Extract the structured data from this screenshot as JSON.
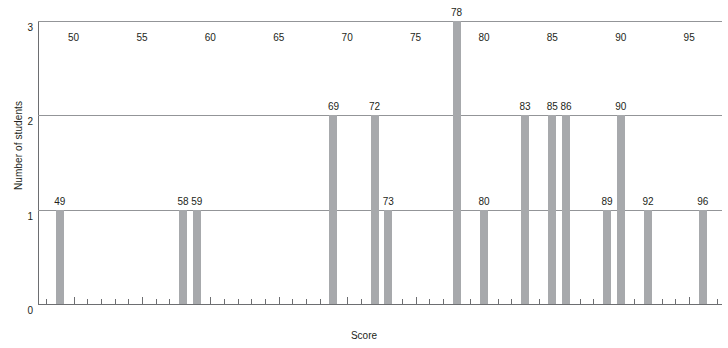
{
  "chart_data": {
    "type": "bar",
    "title": "",
    "xlabel": "Score",
    "ylabel": "Number of students",
    "xlim": [
      47.4,
      97.4
    ],
    "ylim": [
      0,
      3
    ],
    "grid": true,
    "legend": null,
    "x_tick_step": 1,
    "x_label_step": 5,
    "x_tick_labels": [
      "50",
      "55",
      "60",
      "65",
      "70",
      "75",
      "80",
      "85",
      "90",
      "95"
    ],
    "x_tick_label_values": [
      50,
      55,
      60,
      65,
      70,
      75,
      80,
      85,
      90,
      95
    ],
    "y_tick_labels": [
      "0",
      "1",
      "2",
      "3"
    ],
    "y_tick_values": [
      0,
      1,
      2,
      3
    ],
    "categories": [
      49,
      58,
      59,
      69,
      72,
      73,
      78,
      80,
      83,
      85,
      86,
      89,
      90,
      92,
      96
    ],
    "values": [
      1,
      1,
      1,
      2,
      2,
      1,
      3,
      1,
      2,
      2,
      2,
      1,
      2,
      1,
      1
    ],
    "bar_labels": [
      "49",
      "58",
      "59",
      "69",
      "72",
      "73",
      "78",
      "80",
      "83",
      "85",
      "86",
      "89",
      "90",
      "92",
      "96"
    ],
    "colors": {
      "bar": "#a7a9ac",
      "axis": "#6d6e71",
      "grid": "#939598",
      "text": "#231f20",
      "background": "#ffffff"
    }
  }
}
